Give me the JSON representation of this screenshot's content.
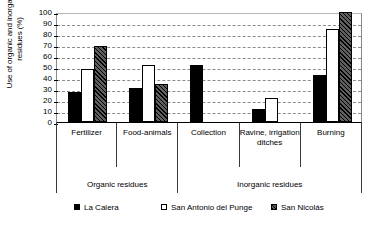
{
  "chart_data": {
    "type": "bar",
    "title": "",
    "xlabel": "",
    "ylabel": "Use of organic and inorganic residues (%)",
    "ylim": [
      0,
      100
    ],
    "ytick_step": 10,
    "yticks": [
      100,
      90,
      80,
      70,
      60,
      50,
      40,
      30,
      20,
      10,
      0
    ],
    "grid": true,
    "legend_position": "bottom",
    "categories": [
      "Fertilizer",
      "Food-animals",
      "Collection",
      "Ravine, irrigation ditches",
      "Burning"
    ],
    "groups": [
      {
        "label": "Organic residues",
        "span": 2
      },
      {
        "label": "Inorganic residues",
        "span": 3
      }
    ],
    "series": [
      {
        "name": "La Calera",
        "style": "solid",
        "values": [
          27,
          31,
          52,
          12,
          43
        ]
      },
      {
        "name": "San Antonio del Punge",
        "style": "open",
        "values": [
          48,
          52,
          null,
          22,
          85
        ]
      },
      {
        "name": "San Nicolás",
        "style": "hatch",
        "values": [
          69,
          35,
          null,
          null,
          100
        ]
      }
    ]
  },
  "legend": {
    "items": [
      {
        "label": "La Calera"
      },
      {
        "label": "San Antonio del Punge"
      },
      {
        "label": "San Nicolás"
      }
    ]
  }
}
